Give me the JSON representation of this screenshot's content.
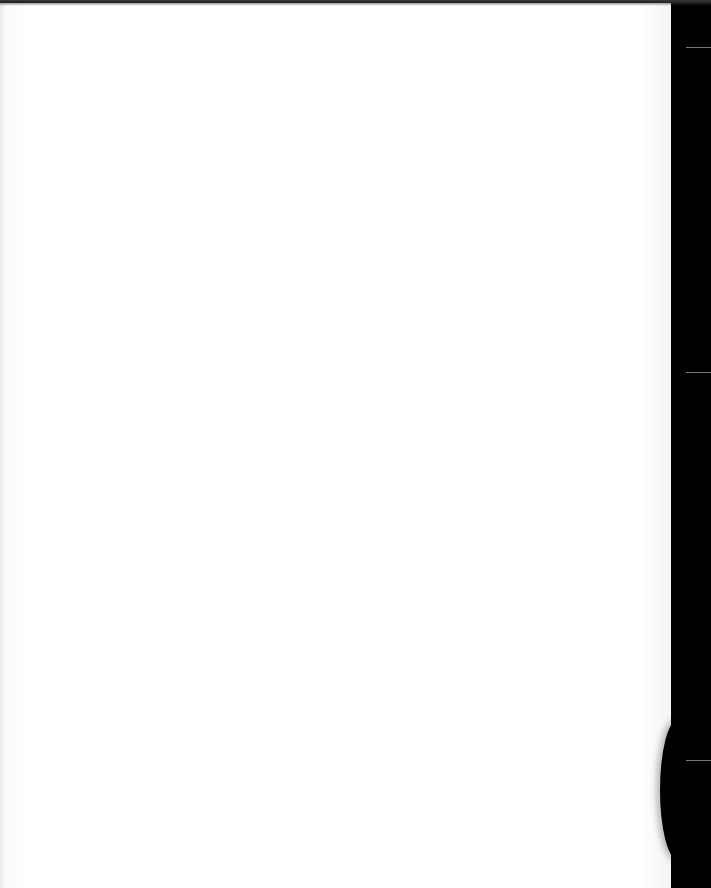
{
  "scene": {
    "description": "Blank sheet of white paper photographed against a black background",
    "paper_color": "#ffffff",
    "background_color": "#000000",
    "text": ""
  }
}
